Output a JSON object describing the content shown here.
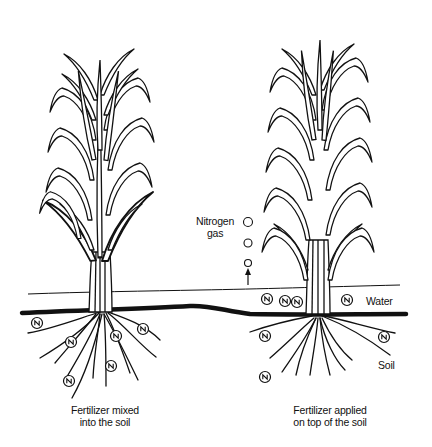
{
  "diagram": {
    "left_panel": {
      "caption_line1": "Fertilizer mixed",
      "caption_line2": "into the soil",
      "nitrogen_symbol": "N",
      "n_particles_count": 6
    },
    "right_panel": {
      "caption_line1": "Fertilizer applied",
      "caption_line2": "on top of the soil",
      "nitrogen_symbol": "N",
      "n_particles_in_water": 4,
      "n_particles_in_soil": 3
    },
    "labels": {
      "nitrogen_gas_line1": "Nitrogen",
      "nitrogen_gas_line2": "gas",
      "water": "Water",
      "soil": "Soil"
    },
    "colors": {
      "ink": "#111111",
      "background": "#ffffff"
    }
  }
}
